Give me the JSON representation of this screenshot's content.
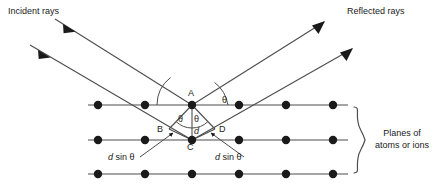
{
  "figure": {
    "type": "bragg-diffraction-diagram",
    "title_incident": "Incident rays",
    "title_reflected": "Reflected rays",
    "planes_label_line1": "Planes of",
    "planes_label_line2": "atoms or ions",
    "colors": {
      "stroke": "#4d4d4d",
      "atom": "#1a1a1a",
      "text": "#1a1a1a",
      "background": "#ffffff"
    },
    "points": {
      "a": "A",
      "b": "B",
      "c": "C",
      "d": "D"
    },
    "angles": {
      "theta_top_left": "θ",
      "theta_top_right": "θ",
      "theta_lower_left": "θ",
      "theta_lower_right": "θ"
    },
    "spacing_label": "d",
    "path_difference_left": "d sin θ",
    "path_difference_right": "d sin θ",
    "path_difference_left_italic": "d",
    "path_difference_left_rest": " sin θ",
    "path_difference_right_italic": "d",
    "path_difference_right_rest": " sin θ",
    "lattice": {
      "rows": 3,
      "atoms_per_row": 6,
      "row_y": [
        105,
        140,
        174
      ],
      "first_atom_x": 98,
      "atom_spacing": 47,
      "atom_radius": 4.2
    },
    "geometry": {
      "point_a": [
        192,
        105
      ],
      "point_c": [
        192,
        140
      ],
      "point_b": [
        169,
        129
      ],
      "point_d": [
        215,
        129
      ],
      "incident_ray1_start": [
        55,
        19
      ],
      "incident_ray2_start": [
        30,
        45
      ],
      "reflected_ray1_end": [
        324,
        22
      ],
      "reflected_ray2_end": [
        352,
        49
      ]
    }
  }
}
